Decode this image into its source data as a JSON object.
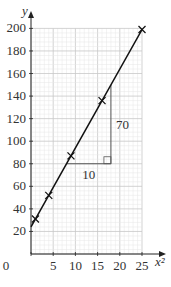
{
  "chart_data": {
    "type": "line",
    "title": "",
    "xlabel": "x²",
    "ylabel": "y",
    "x_ticks": [
      "0",
      "5",
      "10",
      "15",
      "20",
      "25"
    ],
    "y_ticks": [
      "20",
      "40",
      "60",
      "80",
      "100",
      "120",
      "140",
      "160",
      "180",
      "200"
    ],
    "xlim": [
      0,
      25
    ],
    "ylim": [
      0,
      200
    ],
    "grid": true,
    "series": [
      {
        "name": "data points",
        "marker": "x",
        "x": [
          1,
          4,
          9,
          16,
          25
        ],
        "y": [
          31,
          52,
          87,
          136,
          199
        ]
      },
      {
        "name": "line of best fit",
        "x": [
          0,
          25
        ],
        "y": [
          24,
          199
        ]
      }
    ],
    "gradient_triangle": {
      "x_from": 8,
      "x_to": 18,
      "y_from": 80,
      "y_to": 150,
      "run_label": "10",
      "rise_label": "70"
    }
  }
}
